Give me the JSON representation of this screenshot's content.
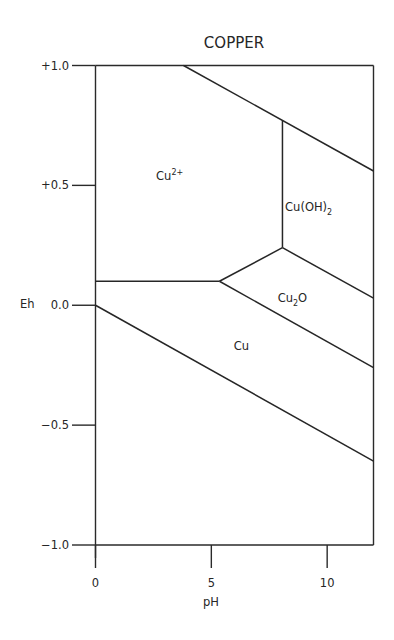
{
  "chart_data": {
    "type": "line",
    "title": "COPPER",
    "xlabel": "pH",
    "ylabel": "Eh",
    "xlim": [
      0,
      12
    ],
    "ylim": [
      -1.0,
      1.0
    ],
    "x_ticks": [
      {
        "value": 0,
        "label": "0"
      },
      {
        "value": 5,
        "label": "5"
      },
      {
        "value": 10,
        "label": "10"
      }
    ],
    "y_ticks": [
      {
        "value": 1.0,
        "label": "+1.0"
      },
      {
        "value": 0.5,
        "label": "+0.5"
      },
      {
        "value": 0.0,
        "label": "0.0"
      },
      {
        "value": -0.5,
        "label": "−0.5"
      },
      {
        "value": -1.0,
        "label": "−1.0"
      }
    ],
    "grid": false,
    "boundaries": [
      {
        "name": "Cu2+/Cu(OH)2 upper water line",
        "points": [
          [
            3.8,
            1.0
          ],
          [
            12,
            0.56
          ]
        ]
      },
      {
        "name": "Cu2+/Cu(OH)2",
        "points": [
          [
            8.07,
            0.77
          ],
          [
            8.07,
            0.24
          ]
        ]
      },
      {
        "name": "Cu2+/Cu",
        "points": [
          [
            0,
            0.1
          ],
          [
            5.35,
            0.1
          ]
        ]
      },
      {
        "name": "Cu2+/Cu2O",
        "points": [
          [
            5.35,
            0.1
          ],
          [
            8.07,
            0.24
          ]
        ]
      },
      {
        "name": "Cu(OH)2/Cu2O",
        "points": [
          [
            8.07,
            0.24
          ],
          [
            12,
            0.03
          ]
        ]
      },
      {
        "name": "Cu2O/Cu",
        "points": [
          [
            5.35,
            0.1
          ],
          [
            12,
            -0.26
          ]
        ]
      },
      {
        "name": "lower water line",
        "points": [
          [
            0,
            0.0
          ],
          [
            12,
            -0.65
          ]
        ]
      }
    ],
    "regions": [
      {
        "label": "Cu",
        "superscript": "2+",
        "subscript": "",
        "suffix": "",
        "x": 3.2,
        "y": 0.54
      },
      {
        "label": "Cu(OH)",
        "superscript": "",
        "subscript": "2",
        "suffix": "",
        "x": 9.2,
        "y": 0.41
      },
      {
        "label": "Cu",
        "superscript": "",
        "subscript": "2",
        "suffix": "O",
        "x": 8.5,
        "y": 0.03
      },
      {
        "label": "Cu",
        "superscript": "",
        "subscript": "",
        "suffix": "",
        "x": 6.3,
        "y": -0.17
      }
    ]
  }
}
